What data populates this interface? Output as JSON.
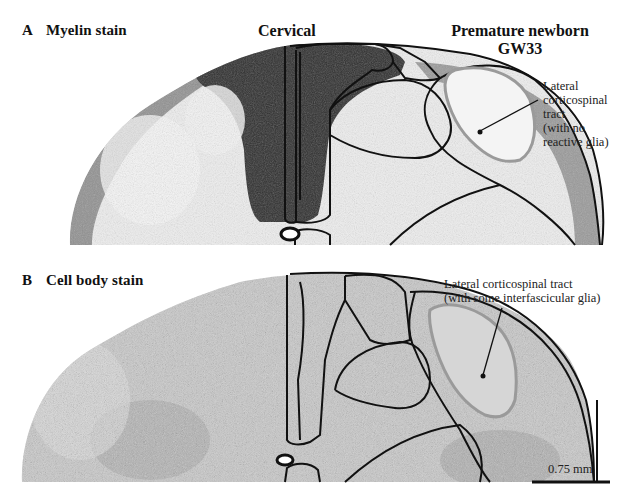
{
  "figure": {
    "header": {
      "region_title": "Cervical",
      "subject_line1": "Premature newborn",
      "subject_line2": "GW33"
    },
    "panels": [
      {
        "letter": "A",
        "title": "Myelin stain",
        "annotation": {
          "lines": [
            "Lateral",
            "corticospinal",
            "tract",
            "(with no",
            "reactive glia)"
          ]
        }
      },
      {
        "letter": "B",
        "title": "Cell body stain",
        "annotation": {
          "lines": [
            "Lateral corticospinal tract",
            "(with some interfascicular glia)"
          ]
        }
      }
    ],
    "scale_bar": {
      "label": "0.75 mm"
    },
    "colors": {
      "outline": "#111111",
      "tract_outline": "#9a9a9a",
      "myelin_dark": "#2e2e2e",
      "tissue_light": "#e6e6e6",
      "cellbody_tissue": "#bdbdbd"
    }
  }
}
